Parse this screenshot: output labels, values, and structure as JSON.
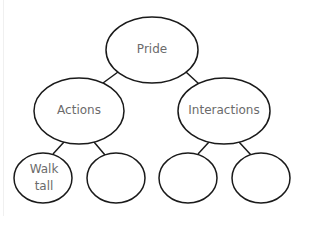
{
  "diagram": {
    "type": "tree",
    "stroke_color": "#1a1a1a",
    "text_color": "#6b6b6b",
    "nodes": [
      {
        "id": "root",
        "label": "Pride",
        "cx": 152,
        "cy": 50,
        "rx": 46,
        "ry": 33
      },
      {
        "id": "actions",
        "label": "Actions",
        "cx": 79,
        "cy": 111,
        "rx": 45,
        "ry": 33
      },
      {
        "id": "interactions",
        "label": "Interactions",
        "cx": 224,
        "cy": 111,
        "rx": 46,
        "ry": 33
      },
      {
        "id": "walk-tall",
        "label": "Walk\ntall",
        "cx": 43,
        "cy": 178,
        "rx": 29,
        "ry": 25
      },
      {
        "id": "actions-blank",
        "label": "",
        "cx": 116,
        "cy": 178,
        "rx": 29,
        "ry": 25
      },
      {
        "id": "interactions-blank-1",
        "label": "",
        "cx": 188,
        "cy": 178,
        "rx": 29,
        "ry": 25
      },
      {
        "id": "interactions-blank-2",
        "label": "",
        "cx": 261,
        "cy": 178,
        "rx": 29,
        "ry": 25
      }
    ],
    "edges": [
      [
        "root",
        "actions"
      ],
      [
        "root",
        "interactions"
      ],
      [
        "actions",
        "walk-tall"
      ],
      [
        "actions",
        "actions-blank"
      ],
      [
        "interactions",
        "interactions-blank-1"
      ],
      [
        "interactions",
        "interactions-blank-2"
      ]
    ]
  },
  "labels": {
    "root": "Pride",
    "actions": "Actions",
    "interactions": "Interactions",
    "walk_tall": "Walk\ntall"
  }
}
